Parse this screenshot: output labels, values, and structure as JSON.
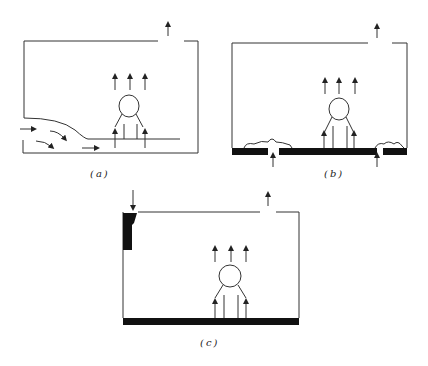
{
  "figure": {
    "panels": [
      {
        "id": "a",
        "label": "(a)",
        "description": "Room with displacement inflow entering at low level through lower-left opening, rising plume above occupant, exhaust at top"
      },
      {
        "id": "b",
        "label": "(b)",
        "description": "Room with floor supply openings (black floor with gaps), heat sources on floor, plume above occupant, exhaust at top"
      },
      {
        "id": "c",
        "label": "(c)",
        "description": "Room with upper-left wall supply, black floor, plume above occupant, exhaust at top"
      }
    ],
    "colors": {
      "line": "#333333",
      "fill": "#111111",
      "background": "#ffffff"
    }
  }
}
